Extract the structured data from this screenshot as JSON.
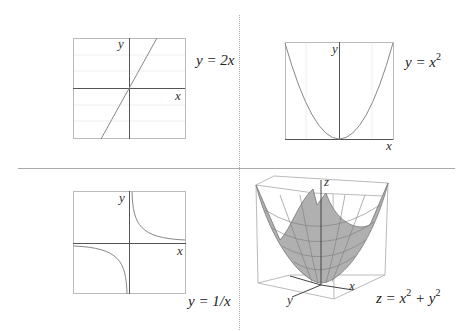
{
  "panels": [
    {
      "id": "linear",
      "equation": "y = 2x",
      "xlabel": "x",
      "ylabel": "y"
    },
    {
      "id": "parabola",
      "equation_base": "y = x",
      "equation_exp": "2",
      "xlabel": "x",
      "ylabel": "y"
    },
    {
      "id": "hyperbola",
      "equation": "y = 1/x",
      "xlabel": "x",
      "ylabel": "y"
    },
    {
      "id": "paraboloid",
      "eq_z": "z = x",
      "eq_exp1": "2",
      "eq_plus": " + y",
      "eq_exp2": "2",
      "xlabel": "x",
      "ylabel": "y",
      "zlabel": "z"
    }
  ],
  "colors": {
    "curve": "#888888",
    "axis": "#555555",
    "box": "#bbbbbb",
    "divider": "#999999",
    "surface": "#b0b0b0",
    "mesh": "#7a7a7a"
  }
}
